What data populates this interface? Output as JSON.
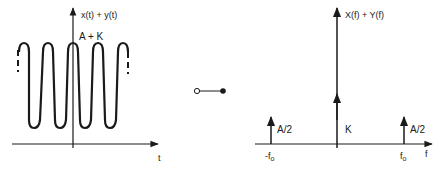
{
  "left_plot": {
    "y_axis_label": "x(t) + y(t)",
    "peak_label": "A + K",
    "x_axis_label": "t"
  },
  "connector": {
    "symbol": "transform-pair"
  },
  "right_plot": {
    "y_axis_label": "X(f) + Y(f)",
    "center_label": "K",
    "left_impulse_label": "A/2",
    "right_impulse_label": "A/2",
    "neg_freq_label": "-f",
    "neg_freq_sub": "o",
    "pos_freq_label": "f",
    "pos_freq_sub": "o",
    "x_axis_label": "f"
  },
  "colors": {
    "ink": "#1a1a1a",
    "background": "#ffffff"
  }
}
